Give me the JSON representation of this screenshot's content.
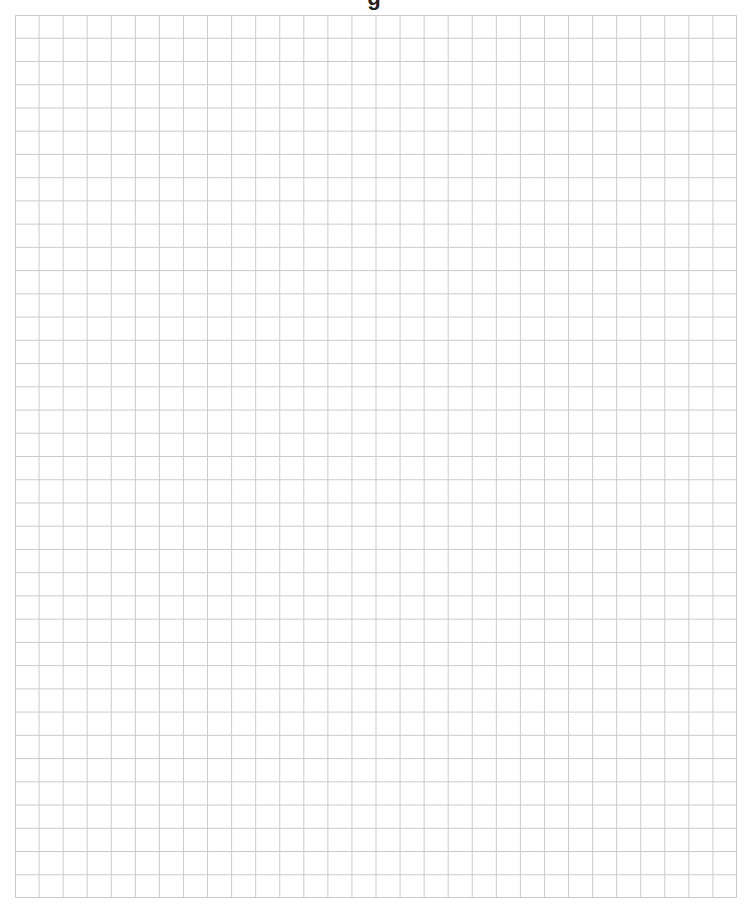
{
  "page": {
    "title_visible_fragment": "g",
    "background_color": "#ffffff"
  },
  "grid": {
    "columns": 30,
    "rows": 38,
    "left": 15,
    "top": 15,
    "width": 722,
    "height": 883,
    "line_color": "#cbcbcf",
    "line_width": 1,
    "filled_cells": []
  }
}
